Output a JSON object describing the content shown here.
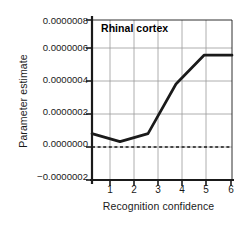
{
  "chart_data": {
    "type": "line",
    "title": "Rhinal cortex",
    "xlabel": "Recognition confidence",
    "ylabel": "Parameter estimate",
    "x": [
      1,
      2,
      3,
      4,
      5,
      6
    ],
    "values": [
      9e-08,
      4e-08,
      9e-08,
      4e-07,
      5.8e-07,
      5.8e-07
    ],
    "series": [
      {
        "name": "Rhinal cortex",
        "values": [
          9e-08,
          4e-08,
          9e-08,
          4e-07,
          5.8e-07,
          5.8e-07
        ]
      }
    ],
    "xlim": [
      1,
      6
    ],
    "ylim": [
      -2e-07,
      8e-07
    ],
    "xtick_labels": [
      "1",
      "2",
      "3",
      "4",
      "5",
      "6"
    ],
    "ytick_values": [
      8e-07,
      6e-07,
      4e-07,
      2e-07,
      0.0,
      -2e-07
    ],
    "ytick_labels": [
      "0.0000008",
      "0.0000006",
      "0.0000004",
      "0.0000002",
      "0.0000000",
      "−0.0000002"
    ],
    "grid": true,
    "legend": "none",
    "annotations": [
      {
        "type": "reference-line",
        "orientation": "horizontal",
        "value": 0.0,
        "style": "dashed"
      }
    ],
    "colors": {
      "line": "#1a1a1a",
      "grid": "#9a9a9a",
      "axis": "#1a1a1a",
      "background": "#ffffff",
      "zero_line": "#1a1a1a"
    }
  }
}
